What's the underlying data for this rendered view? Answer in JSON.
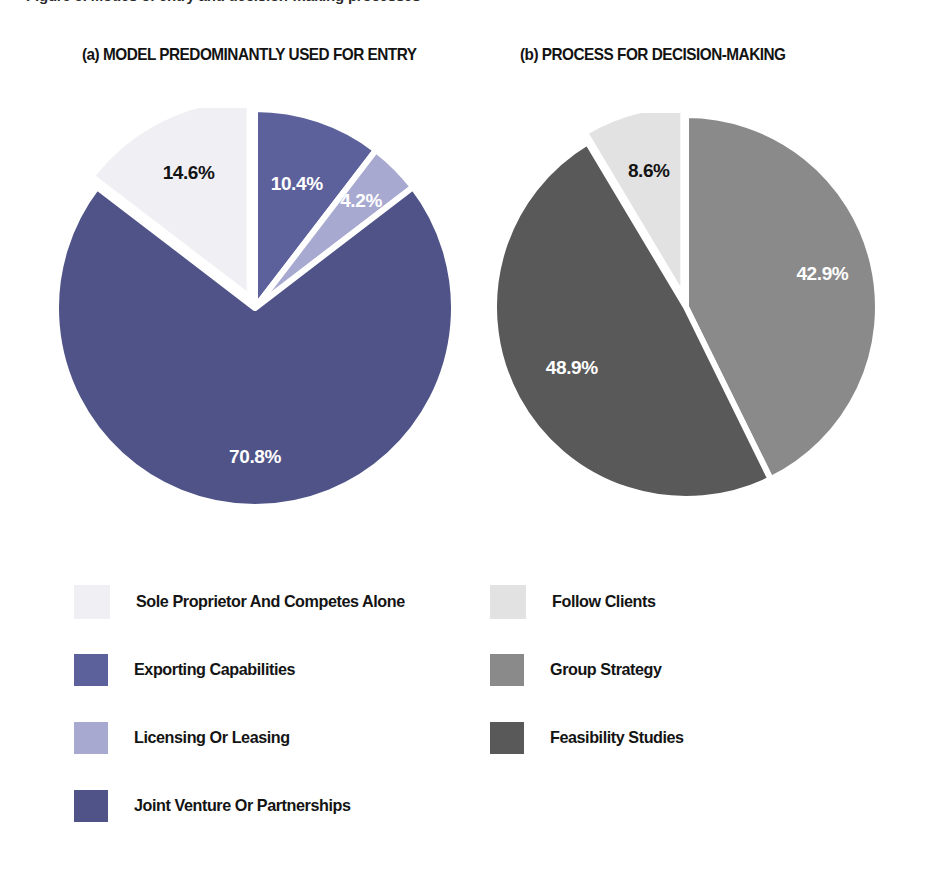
{
  "figure": {
    "clipped_caption": "Figure 5. Modes of entry and decision-making processes",
    "panels": [
      {
        "id": "a",
        "title": "(a)  MODEL PREDOMINANTLY USED FOR ENTRY"
      },
      {
        "id": "b",
        "title": "(b)  PROCESS FOR DECISION-MAKING"
      }
    ]
  },
  "chart_data": [
    {
      "type": "pie",
      "title": "(a)  MODEL PREDOMINANTLY USED FOR ENTRY",
      "categories": [
        "Exporting Capabilities",
        "Licensing Or Leasing",
        "Joint Venture Or Partnerships",
        "Sole Proprietor And Competes Alone"
      ],
      "values": [
        10.4,
        4.2,
        70.8,
        14.6
      ],
      "value_labels": [
        "10.4%",
        "4.2%",
        "70.8%",
        "14.6%"
      ],
      "colors": [
        "#5d619b",
        "#a7a9d0",
        "#4f5387",
        "#f0f0f4"
      ],
      "label_colors": [
        "#ffffff",
        "#ffffff",
        "#ffffff",
        "#141414"
      ],
      "start_angle_deg": 0,
      "direction": "clockwise",
      "legend_position": "below",
      "legend": [
        {
          "label": "Sole Proprietor And Competes Alone",
          "color": "#f0f0f4"
        },
        {
          "label": "Exporting Capabilities",
          "color": "#5d619b"
        },
        {
          "label": "Licensing Or Leasing",
          "color": "#a7a9d0"
        },
        {
          "label": "Joint Venture Or Partnerships",
          "color": "#4f5387"
        }
      ]
    },
    {
      "type": "pie",
      "title": "(b)  PROCESS FOR DECISION-MAKING",
      "categories": [
        "Group Strategy",
        "Feasibility Studies",
        "Follow Clients"
      ],
      "values": [
        42.9,
        48.9,
        8.6
      ],
      "value_labels": [
        "42.9%",
        "48.9%",
        "8.6%"
      ],
      "colors": [
        "#8a8a8a",
        "#595959",
        "#e2e2e2"
      ],
      "label_colors": [
        "#ffffff",
        "#ffffff",
        "#141414"
      ],
      "start_angle_deg": 0,
      "direction": "clockwise",
      "legend_position": "below",
      "legend": [
        {
          "label": "Follow Clients",
          "color": "#e2e2e2"
        },
        {
          "label": "Group Strategy",
          "color": "#8a8a8a"
        },
        {
          "label": "Feasibility Studies",
          "color": "#595959"
        }
      ]
    }
  ]
}
